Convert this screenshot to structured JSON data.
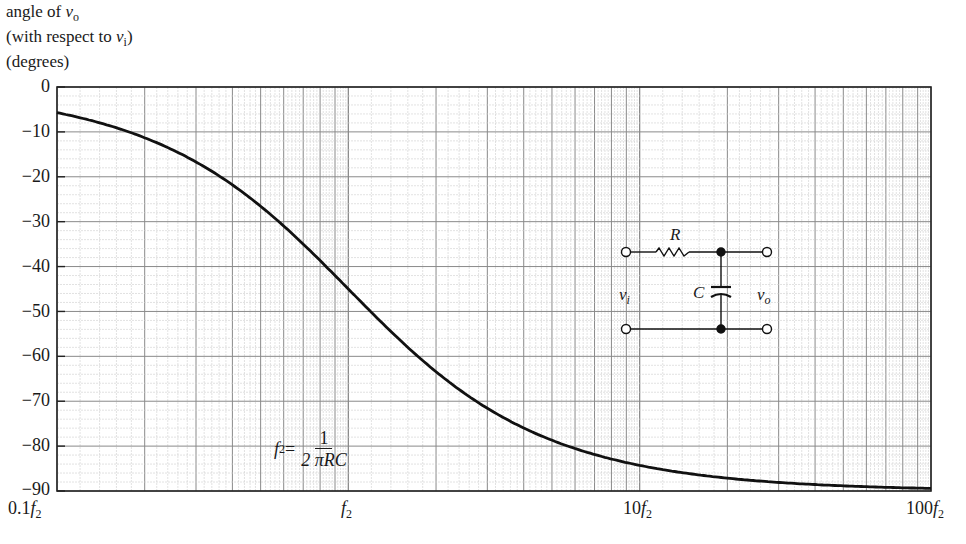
{
  "chart_data": {
    "type": "line",
    "title": "",
    "ylabel_lines": [
      "angle of v_o",
      "(with respect to v_i)",
      "(degrees)"
    ],
    "xlabel": "",
    "x_scale": "log",
    "xlim": [
      0.1,
      100
    ],
    "ylim": [
      -90,
      0
    ],
    "grid": true,
    "x_ticks": [
      {
        "value": 0.1,
        "label": "0.1f2"
      },
      {
        "value": 1,
        "label": "f2"
      },
      {
        "value": 10,
        "label": "10f2"
      },
      {
        "value": 100,
        "label": "100f2"
      }
    ],
    "y_ticks": [
      0,
      -10,
      -20,
      -30,
      -40,
      -50,
      -60,
      -70,
      -80,
      -90
    ],
    "series": [
      {
        "name": "phase of vo relative to vi",
        "x": [
          0.1,
          0.15,
          0.2,
          0.3,
          0.5,
          0.7,
          1,
          1.5,
          2,
          3,
          5,
          7,
          10,
          20,
          50,
          100
        ],
        "values": [
          -5.7,
          -8.5,
          -11.3,
          -16.7,
          -26.6,
          -35.0,
          -45.0,
          -56.3,
          -63.4,
          -71.6,
          -78.7,
          -81.9,
          -84.3,
          -87.1,
          -88.9,
          -89.4
        ]
      }
    ],
    "annotations": [
      {
        "type": "formula",
        "text": "f2 = 1 / (2 πRC)"
      },
      {
        "type": "circuit",
        "text": "RC low-pass: series R, shunt C, input vi, output vo"
      }
    ]
  },
  "axis": {
    "ylabel_line1": "angle of ",
    "ylabel_line1_var": "v",
    "ylabel_line1_sub": "o",
    "ylabel_line2_pre": "(with respect to ",
    "ylabel_line2_var": "v",
    "ylabel_line2_sub": "i",
    "ylabel_line2_post": ")",
    "ylabel_line3": "(degrees)",
    "yticks": [
      "0",
      "−10",
      "−20",
      "−30",
      "−40",
      "−50",
      "−60",
      "−70",
      "−80",
      "−90"
    ],
    "xtick_0_pre": "0.1",
    "xtick_1_pre": "",
    "xtick_2_pre": "10",
    "xtick_3_pre": "100",
    "xtick_var": "f",
    "xtick_sub": "2"
  },
  "formula": {
    "lhs_var": "f",
    "lhs_sub": "2",
    "eq": " =",
    "numerator": "1",
    "denominator": "2 πRC"
  },
  "circuit": {
    "r_label": "R",
    "c_label": "C",
    "vin_var": "v",
    "vin_sub": "i",
    "vout_var": "v",
    "vout_sub": "o"
  }
}
